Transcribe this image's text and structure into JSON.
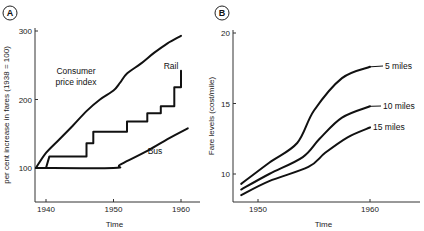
{
  "panels": [
    {
      "badge": "A"
    },
    {
      "badge": "B"
    }
  ],
  "chart_data": [
    {
      "type": "line",
      "panel": "A",
      "title": "",
      "xlabel": "Time",
      "ylabel": "per cent increase in fares (1938 = 100)",
      "xlim": [
        1938,
        1962
      ],
      "ylim": [
        50,
        300
      ],
      "x_ticks": [
        "1940",
        "1950",
        "1960"
      ],
      "y_ticks": [
        "100",
        "200",
        "300"
      ],
      "grid": false,
      "series": [
        {
          "name": "Consumer price index",
          "label": "Consumer price index",
          "label_lines": [
            "Consumer",
            "price index"
          ],
          "x": [
            1938.5,
            1940,
            1942,
            1944,
            1946,
            1948,
            1950,
            1951,
            1952,
            1954,
            1956,
            1958,
            1960
          ],
          "y": [
            100,
            122,
            142,
            162,
            183,
            200,
            213,
            225,
            238,
            252,
            268,
            282,
            293
          ]
        },
        {
          "name": "Rail",
          "label": "Rail",
          "type": "step",
          "x": [
            1940,
            1940.5,
            1946,
            1946,
            1947,
            1947,
            1952,
            1952,
            1955,
            1955,
            1957,
            1957,
            1959,
            1959,
            1960,
            1960
          ],
          "y": [
            100,
            117,
            117,
            136,
            136,
            153,
            153,
            168,
            168,
            180,
            180,
            190,
            190,
            218,
            218,
            242
          ]
        },
        {
          "name": "Bus",
          "label": "Bus",
          "x": [
            1938.5,
            1950,
            1951,
            1955,
            1958,
            1961
          ],
          "y": [
            100,
            100,
            105,
            125,
            142,
            158
          ]
        }
      ]
    },
    {
      "type": "line",
      "panel": "B",
      "title": "",
      "xlabel": "Time",
      "ylabel": "Fare levels (cost/mile)",
      "xlim": [
        1948,
        1964
      ],
      "ylim": [
        8,
        20
      ],
      "x_ticks": [
        "1950",
        "1960"
      ],
      "y_ticks": [
        "10",
        "15",
        "20"
      ],
      "grid": false,
      "series": [
        {
          "name": "5 miles",
          "label": "5 miles",
          "x": [
            1948.5,
            1951,
            1953.5,
            1955,
            1957.5,
            1960
          ],
          "y": [
            9.3,
            10.8,
            12.2,
            14.5,
            16.8,
            17.6
          ]
        },
        {
          "name": "10 miles",
          "label": "10 miles",
          "x": [
            1948.5,
            1951,
            1954,
            1955.5,
            1957.5,
            1960
          ],
          "y": [
            8.9,
            10.0,
            11.2,
            12.5,
            14.0,
            14.8
          ]
        },
        {
          "name": "15 miles",
          "label": "15 miles",
          "x": [
            1948.5,
            1951,
            1954.5,
            1956,
            1958,
            1960
          ],
          "y": [
            8.5,
            9.5,
            10.5,
            11.5,
            12.6,
            13.3
          ]
        }
      ]
    }
  ]
}
